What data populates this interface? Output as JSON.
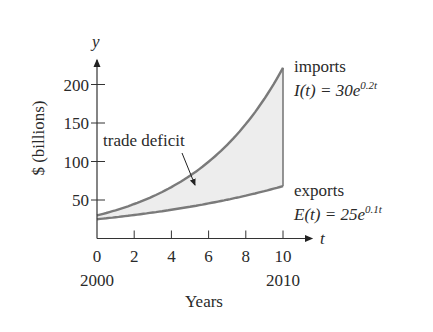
{
  "chart_data": {
    "type": "area",
    "title": "",
    "xlabel": "Years",
    "ylabel": "$ (billions)",
    "x_axis_symbol": "t",
    "y_axis_symbol": "y",
    "x_ticks": [
      0,
      2,
      4,
      6,
      8,
      10
    ],
    "x_tick_labels": [
      "0",
      "2",
      "4",
      "6",
      "8",
      "10"
    ],
    "x_year_labels": [
      {
        "t": 0,
        "label": "2000"
      },
      {
        "t": 10,
        "label": "2010"
      }
    ],
    "y_ticks": [
      50,
      100,
      150,
      200
    ],
    "y_tick_labels": [
      "50",
      "100",
      "150",
      "200"
    ],
    "xlim": [
      0,
      10
    ],
    "ylim": [
      0,
      230
    ],
    "grid": false,
    "x": [
      0,
      1,
      2,
      3,
      4,
      5,
      6,
      7,
      8,
      9,
      10
    ],
    "series": [
      {
        "name": "imports",
        "formula": "I(t) = 30e^{0.2t}",
        "values": [
          30.0,
          36.6,
          44.8,
          54.7,
          66.8,
          81.5,
          99.6,
          121.6,
          148.6,
          181.5,
          221.7
        ]
      },
      {
        "name": "exports",
        "formula": "E(t) = 25e^{0.1t}",
        "values": [
          25.0,
          27.6,
          30.5,
          33.7,
          37.3,
          41.2,
          45.6,
          50.3,
          55.6,
          61.5,
          68.0
        ]
      }
    ],
    "shaded_region": "trade deficit",
    "annotations": [
      {
        "text": "trade deficit",
        "arrow_to": [
          5.5,
          70
        ]
      },
      {
        "text": "imports",
        "sub": "I(t) = 30e",
        "exp": "0.2t"
      },
      {
        "text": "exports",
        "sub": "E(t) = 25e",
        "exp": "0.1t"
      }
    ]
  },
  "labels": {
    "y_symbol": "y",
    "t_symbol": "t",
    "ylabel": "$ (billions)",
    "xlabel": "Years",
    "year_start": "2000",
    "year_end": "2010",
    "deficit": "trade deficit",
    "imports": "imports",
    "imports_prefix": "I(t) = 30e",
    "imports_exp": "0.2t",
    "exports": "exports",
    "exports_prefix": "E(t) = 25e",
    "exports_exp": "0.1t",
    "xt": [
      "0",
      "2",
      "4",
      "6",
      "8",
      "10"
    ],
    "yt": [
      "50",
      "100",
      "150",
      "200"
    ]
  }
}
